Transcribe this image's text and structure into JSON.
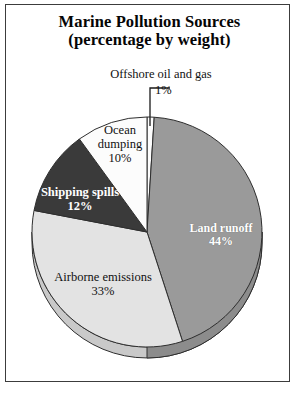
{
  "figure": {
    "title_line1": "Marine Pollution Sources",
    "title_line2": "(percentage by weight)",
    "frame_color": "#3c3c3c",
    "background": "#ffffff"
  },
  "chart_data": {
    "type": "pie",
    "title": "Marine Pollution Sources (percentage by weight)",
    "subtitle": "(percentage by weight)",
    "units": "percentage by weight",
    "xlabel": "",
    "ylabel": "",
    "legend": "none",
    "grid": false,
    "total": 100,
    "start_angle_deg": 0,
    "direction": "clockwise",
    "categories": [
      "Offshore oil and gas",
      "Land runoff",
      "Airborne emissions",
      "Shipping spills",
      "Ocean dumping"
    ],
    "values": [
      1,
      44,
      33,
      12,
      10
    ],
    "slices": [
      {
        "label": "Offshore oil and gas",
        "value": 1,
        "value_text": "1%",
        "color": "#fdfdfd",
        "text_color": "#111111",
        "callout": true,
        "label_position": "outside-top"
      },
      {
        "label": "Land runoff",
        "value": 44,
        "value_text": "44%",
        "color": "#9a9a9a",
        "text_color": "#ffffff",
        "callout": false,
        "label_position": "inside-right"
      },
      {
        "label": "Airborne emissions",
        "value": 33,
        "value_text": "33%",
        "color": "#e3e3e3",
        "text_color": "#111111",
        "callout": false,
        "label_position": "inside-bottom-left"
      },
      {
        "label": "Shipping spills",
        "value": 12,
        "value_text": "12%",
        "color": "#3a3a3a",
        "text_color": "#ffffff",
        "callout": false,
        "label_position": "inside-left"
      },
      {
        "label": "Ocean dumping",
        "value": 10,
        "value_text": "10%",
        "color": "#fcfcfc",
        "text_color": "#111111",
        "callout": false,
        "label_position": "inside-upper-left"
      }
    ]
  },
  "labels": {
    "land_runoff_name": "Land runoff",
    "land_runoff_value": "44%",
    "airborne_name": "Airborne emissions",
    "airborne_value": "33%",
    "shipping_name": "Shipping spills",
    "shipping_value": "12%",
    "ocean_name": "Ocean",
    "ocean_name2": "dumping",
    "ocean_value": "10%",
    "offshore_name": "Offshore oil and gas",
    "offshore_value": "1%"
  }
}
